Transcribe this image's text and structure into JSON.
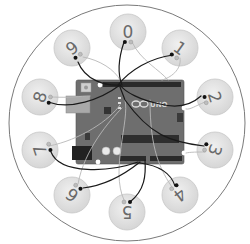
{
  "diagram": {
    "board": {
      "label": "UNO",
      "logo": "infinity-logo",
      "color": "#6e6e6e"
    },
    "outer_ring": {
      "cx": 127,
      "cy": 123,
      "r": 118,
      "stroke": "#7a7a7a"
    },
    "pads": [
      {
        "label": "0",
        "cx": 128,
        "cy": 32,
        "rot": 0
      },
      {
        "label": "1",
        "cx": 180,
        "cy": 48,
        "rot": 36
      },
      {
        "label": "2",
        "cx": 215,
        "cy": 97,
        "rot": 72
      },
      {
        "label": "3",
        "cx": 215,
        "cy": 150,
        "rot": 108
      },
      {
        "label": "4",
        "cx": 180,
        "cy": 195,
        "rot": 144
      },
      {
        "label": "5",
        "cx": 127,
        "cy": 212,
        "rot": 180
      },
      {
        "label": "6",
        "cx": 72,
        "cy": 195,
        "rot": 216
      },
      {
        "label": "7",
        "cx": 40,
        "cy": 150,
        "rot": 252
      },
      {
        "label": "8",
        "cx": 40,
        "cy": 97,
        "rot": 288
      },
      {
        "label": "9",
        "cx": 72,
        "cy": 48,
        "rot": 324
      }
    ],
    "colors": {
      "pad_fill": "#e4e4e4",
      "pad_stroke": "#c8c8c8",
      "wire_dark": "#1a1a1a",
      "wire_light": "#b8b8b8"
    }
  }
}
